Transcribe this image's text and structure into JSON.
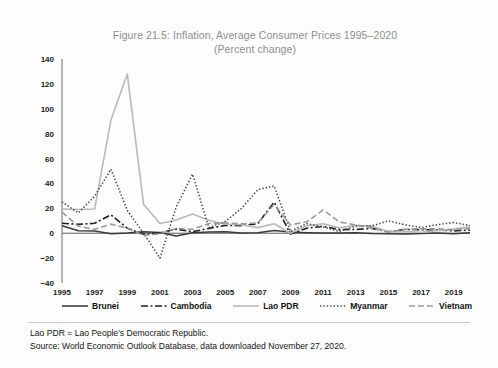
{
  "figure": {
    "title_line1": "Figure 21.5: Inflation, Average Consumer Prices 1995–2020",
    "title_line2": "(Percent change)"
  },
  "footnotes": {
    "definition": "Lao PDR = Lao People's Democratic Republic.",
    "source": "Source: World Economic Outlook Database, data downloaded November 27, 2020."
  },
  "chart_data": {
    "type": "line",
    "title": "Figure 21.5: Inflation, Average Consumer Prices 1995–2020 (Percent change)",
    "xlabel": "",
    "ylabel": "",
    "xlim": [
      1995,
      2020
    ],
    "ylim": [
      -40,
      140
    ],
    "ytick_step": 20,
    "yticks": [
      140,
      120,
      100,
      80,
      60,
      40,
      20,
      0,
      -20,
      -40
    ],
    "xticks": [
      1995,
      1997,
      1999,
      2001,
      2003,
      2005,
      2007,
      2009,
      2011,
      2013,
      2015,
      2017,
      2019
    ],
    "x": [
      1995,
      1996,
      1997,
      1998,
      1999,
      2000,
      2001,
      2002,
      2003,
      2004,
      2005,
      2006,
      2007,
      2008,
      2009,
      2010,
      2011,
      2012,
      2013,
      2014,
      2015,
      2016,
      2017,
      2018,
      2019,
      2020
    ],
    "grid": false,
    "legend_position": "bottom",
    "series": [
      {
        "name": "Brunei",
        "color": "#3b3b3b",
        "dash": "none",
        "width": 1.5,
        "values": [
          6.0,
          2.0,
          1.7,
          -0.4,
          0.1,
          1.2,
          0.6,
          -2.3,
          0.3,
          0.9,
          1.1,
          0.2,
          0.3,
          2.1,
          1.0,
          0.4,
          0.1,
          0.1,
          0.4,
          -0.2,
          -0.4,
          -0.7,
          -0.2,
          0.1,
          -0.4,
          0.3
        ]
      },
      {
        "name": "Cambodia",
        "color": "#1f1f1f",
        "dash": "dashdot",
        "width": 1.6,
        "values": [
          8.0,
          7.1,
          8.0,
          14.8,
          4.0,
          -0.8,
          0.2,
          3.3,
          1.2,
          3.9,
          6.3,
          6.1,
          7.7,
          25.0,
          -0.7,
          4.0,
          5.5,
          2.9,
          3.0,
          3.9,
          1.2,
          3.0,
          2.9,
          2.5,
          1.9,
          2.5
        ]
      },
      {
        "name": "Lao PDR",
        "color": "#b9b9b9",
        "dash": "none",
        "width": 1.6,
        "values": [
          19.4,
          19.1,
          19.5,
          91.0,
          128.0,
          23.2,
          7.8,
          10.6,
          15.5,
          10.5,
          7.2,
          6.8,
          4.5,
          7.6,
          0.0,
          6.0,
          7.6,
          4.3,
          6.4,
          5.5,
          1.3,
          1.6,
          0.8,
          2.0,
          3.3,
          5.1
        ]
      },
      {
        "name": "Myanmar",
        "color": "#4a4a4a",
        "dash": "dot",
        "width": 1.6,
        "values": [
          25.2,
          16.3,
          29.7,
          51.5,
          18.4,
          -0.1,
          -20.0,
          21.1,
          47.5,
          4.5,
          9.4,
          20.0,
          35.0,
          38.0,
          1.5,
          7.7,
          5.0,
          1.5,
          5.7,
          5.9,
          10.0,
          6.8,
          4.6,
          6.9,
          8.6,
          6.1
        ]
      },
      {
        "name": "Vietnam",
        "color": "#9a9a9a",
        "dash": "dash",
        "width": 1.6,
        "values": [
          16.9,
          5.6,
          3.1,
          7.3,
          4.1,
          -1.7,
          -0.4,
          3.9,
          3.2,
          7.8,
          8.3,
          7.5,
          8.3,
          23.1,
          6.7,
          9.2,
          18.7,
          9.1,
          6.6,
          4.1,
          0.9,
          3.2,
          3.5,
          3.5,
          2.8,
          3.8
        ]
      }
    ]
  },
  "legend": {
    "items": [
      {
        "label": "Brunei",
        "icon": "line-solid-dark-icon"
      },
      {
        "label": "Cambodia",
        "icon": "line-dashdot-icon"
      },
      {
        "label": "Lao PDR",
        "icon": "line-solid-light-icon"
      },
      {
        "label": "Myanmar",
        "icon": "line-dotted-icon"
      },
      {
        "label": "Vietnam",
        "icon": "line-dashed-icon"
      }
    ]
  }
}
